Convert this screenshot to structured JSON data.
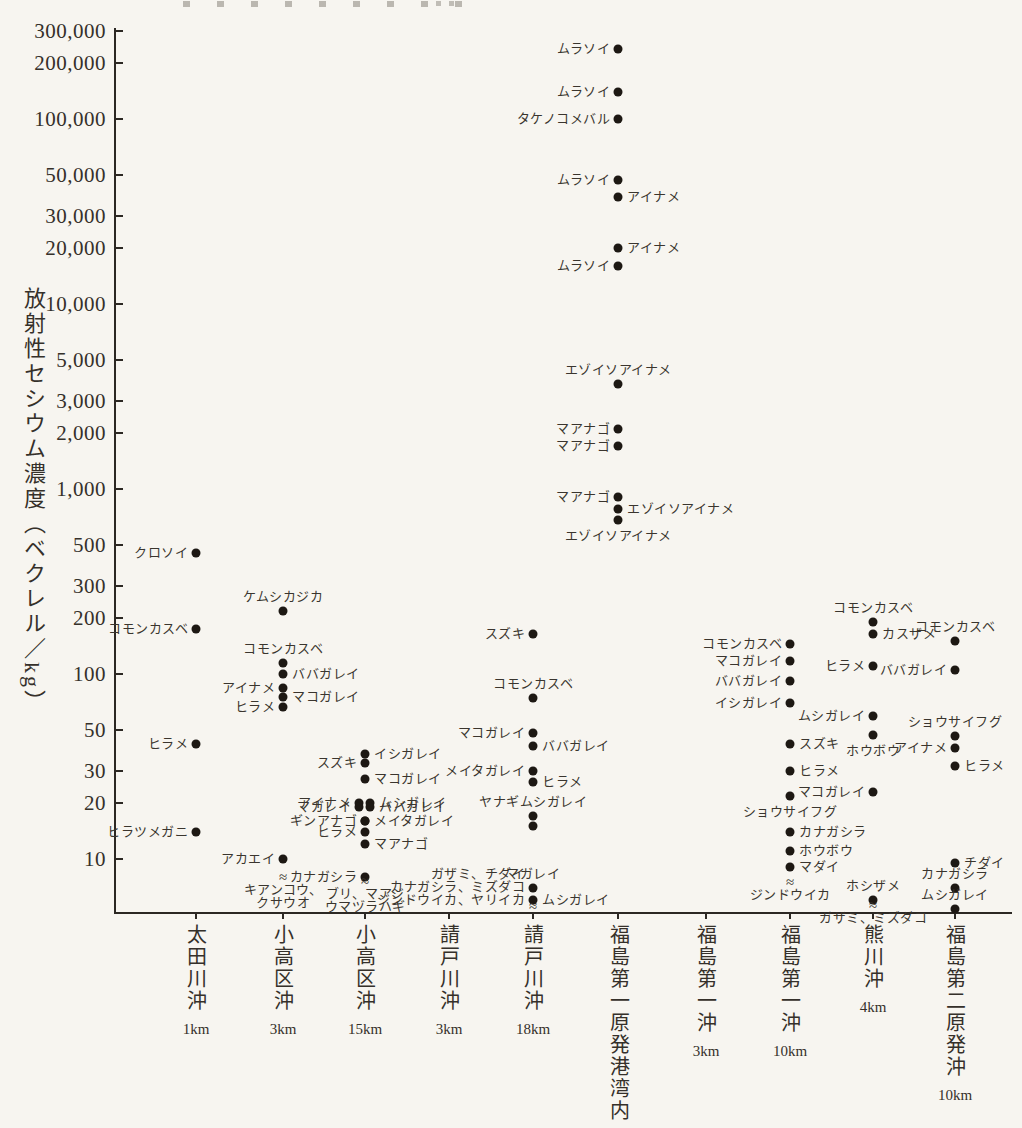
{
  "figure": {
    "background": "#f7f5f0",
    "ink_color": "#2c2823",
    "dot_color": "#1d1813"
  },
  "chart_data": {
    "type": "scatter",
    "title": "",
    "ylabel": "放射性セシウム濃度（ベクレル／kg）",
    "xlabel": "",
    "y_axis": {
      "scale": "log",
      "ylim": [
        5,
        300000
      ],
      "ticks": [
        {
          "label": "300,000",
          "value": 300000
        },
        {
          "label": "200,000",
          "value": 200000
        },
        {
          "label": "100,000",
          "value": 100000
        },
        {
          "label": "50,000",
          "value": 50000
        },
        {
          "label": "30,000",
          "value": 30000
        },
        {
          "label": "20,000",
          "value": 20000
        },
        {
          "label": "10,000",
          "value": 10000
        },
        {
          "label": "5,000",
          "value": 5000
        },
        {
          "label": "3,000",
          "value": 3000
        },
        {
          "label": "2,000",
          "value": 2000
        },
        {
          "label": "1,000",
          "value": 1000
        },
        {
          "label": "500",
          "value": 500
        },
        {
          "label": "300",
          "value": 300
        },
        {
          "label": "200",
          "value": 200
        },
        {
          "label": "100",
          "value": 100
        },
        {
          "label": "50",
          "value": 50
        },
        {
          "label": "30",
          "value": 30
        },
        {
          "label": "20",
          "value": 20
        },
        {
          "label": "10",
          "value": 10
        }
      ]
    },
    "approx_symbol": "≈",
    "locations": [
      {
        "name": "太田川沖",
        "distance": "1km",
        "points": [
          {
            "species": "クロソイ",
            "value": 450,
            "label": "left"
          },
          {
            "species": "コモンカスベ",
            "value": 175,
            "label": "left"
          },
          {
            "species": "ヒラメ",
            "value": 42,
            "label": "left"
          },
          {
            "species": "ヒラツメガニ",
            "value": 14,
            "label": "left"
          }
        ]
      },
      {
        "name": "小高区沖",
        "distance": "3km",
        "points": [
          {
            "species": "ケムシカジカ",
            "value": 220,
            "label": "above"
          },
          {
            "species": "コモンカスベ",
            "value": 115,
            "label": "above"
          },
          {
            "species": "ババガレイ",
            "value": 100,
            "label": "right"
          },
          {
            "species": "アイナメ",
            "value": 84,
            "label": "left"
          },
          {
            "species": "マコガレイ",
            "value": 75,
            "label": "right"
          },
          {
            "species": "ヒラメ",
            "value": 66,
            "label": "left"
          },
          {
            "species": "アカエイ",
            "value": 10,
            "label": "left"
          }
        ],
        "not_detected": [
          "キアンコウ、",
          "クサウオ"
        ]
      },
      {
        "name": "小高区沖",
        "distance": "15km",
        "points": [
          {
            "species": "イシガレイ",
            "value": 37,
            "label": "right"
          },
          {
            "species": "スズキ",
            "value": 33,
            "label": "left"
          },
          {
            "species": "マコガレイ",
            "value": 27,
            "label": "right"
          },
          {
            "species": "アイナメ",
            "value": 20,
            "label": "left",
            "dx": -6
          },
          {
            "species": "ムシガレイ",
            "value": 20,
            "label": "right",
            "dx": 5
          },
          {
            "species": "マガレイ",
            "value": 19,
            "label": "left",
            "dx": -6
          },
          {
            "species": "ババガレイ",
            "value": 19,
            "label": "right",
            "dx": 5
          },
          {
            "species": "ギンアナゴ",
            "value": 16,
            "label": "left"
          },
          {
            "species": "メイタガレイ",
            "value": 16,
            "label": "right"
          },
          {
            "species": "ヒラメ",
            "value": 14,
            "label": "left"
          },
          {
            "species": "マアナゴ",
            "value": 12,
            "label": "right"
          },
          {
            "species": "カナガシラ",
            "value": 8,
            "label": "left"
          }
        ],
        "not_detected": [
          "ブリ、マアジ",
          "ウマヅラハギ"
        ]
      },
      {
        "name": "請戸川沖",
        "distance": "3km",
        "points": []
      },
      {
        "name": "請戸川沖",
        "distance": "18km",
        "points": [
          {
            "species": "スズキ",
            "value": 165,
            "label": "left"
          },
          {
            "species": "コモンカスベ",
            "value": 74,
            "label": "above"
          },
          {
            "species": "マコガレイ",
            "value": 48,
            "label": "left"
          },
          {
            "species": "ババガレイ",
            "value": 41,
            "label": "right"
          },
          {
            "species": "メイタガレイ",
            "value": 30,
            "label": "left"
          },
          {
            "species": "ヒラメ",
            "value": 26,
            "label": "right"
          },
          {
            "species": "ヤナギムシガレイ",
            "value": 17,
            "label": "above"
          },
          {
            "species": "ヤナギムシガレイ",
            "value": 15,
            "label": "none"
          },
          {
            "species": "マガレイ",
            "value": 7,
            "label": "above"
          },
          {
            "species": "ムシガレイ",
            "value": 6,
            "label": "right"
          }
        ],
        "not_detected": [
          "ガザミ、チダイ",
          "カナガシラ、ミズダコ",
          "ジンドウイカ、ヤリイカ"
        ],
        "nd_align": "left"
      },
      {
        "name": "福島第一原発港湾内",
        "distance": "",
        "points": [
          {
            "species": "ムラソイ",
            "value": 240000,
            "label": "left"
          },
          {
            "species": "ムラソイ",
            "value": 140000,
            "label": "left"
          },
          {
            "species": "タケノコメバル",
            "value": 100000,
            "label": "left"
          },
          {
            "species": "ムラソイ",
            "value": 47000,
            "label": "left"
          },
          {
            "species": "アイナメ",
            "value": 38000,
            "label": "right"
          },
          {
            "species": "アイナメ",
            "value": 20000,
            "label": "right"
          },
          {
            "species": "ムラソイ",
            "value": 16000,
            "label": "left"
          },
          {
            "species": "エゾイソアイナメ",
            "value": 3700,
            "label": "above"
          },
          {
            "species": "マアナゴ",
            "value": 2100,
            "label": "left"
          },
          {
            "species": "マアナゴ",
            "value": 1700,
            "label": "left"
          },
          {
            "species": "マアナゴ",
            "value": 900,
            "label": "left"
          },
          {
            "species": "エゾイソアイナメ",
            "value": 780,
            "label": "right"
          },
          {
            "species": "エゾイソアイナメ",
            "value": 680,
            "label": "below"
          }
        ]
      },
      {
        "name": "福島第一沖",
        "distance": "3km",
        "points": []
      },
      {
        "name": "福島第一沖",
        "distance": "10km",
        "points": [
          {
            "species": "コモンカスベ",
            "value": 145,
            "label": "left"
          },
          {
            "species": "マコガレイ",
            "value": 118,
            "label": "left"
          },
          {
            "species": "ババガレイ",
            "value": 92,
            "label": "left"
          },
          {
            "species": "イシガレイ",
            "value": 70,
            "label": "left"
          },
          {
            "species": "スズキ",
            "value": 42,
            "label": "right"
          },
          {
            "species": "ヒラメ",
            "value": 30,
            "label": "right"
          },
          {
            "species": "ショウサイフグ",
            "value": 22,
            "label": "below"
          },
          {
            "species": "カナガシラ",
            "value": 14,
            "label": "right"
          },
          {
            "species": "ホウボウ",
            "value": 11,
            "label": "right"
          },
          {
            "species": "マダイ",
            "value": 9,
            "label": "right"
          }
        ],
        "not_detected": [
          "ジンドウイカ"
        ]
      },
      {
        "name": "熊川沖",
        "distance": "4km",
        "points": [
          {
            "species": "コモンカスベ",
            "value": 190,
            "label": "above"
          },
          {
            "species": "カスザメ",
            "value": 165,
            "label": "right"
          },
          {
            "species": "ヒラメ",
            "value": 110,
            "label": "left"
          },
          {
            "species": "ムシガレイ",
            "value": 59,
            "label": "left"
          },
          {
            "species": "ホウボウ",
            "value": 47,
            "label": "below"
          },
          {
            "species": "マコガレイ",
            "value": 23,
            "label": "left"
          },
          {
            "species": "ホシザメ",
            "value": 6,
            "label": "above"
          }
        ],
        "not_detected": [
          "ガザミ、ミズダコ"
        ]
      },
      {
        "name": "福島第二原発沖",
        "distance": "10km",
        "points": [
          {
            "species": "コモンカスベ",
            "value": 150,
            "label": "above"
          },
          {
            "species": "ババガレイ",
            "value": 105,
            "label": "left"
          },
          {
            "species": "ショウサイフグ",
            "value": 46,
            "label": "above"
          },
          {
            "species": "アイナメ",
            "value": 40,
            "label": "left"
          },
          {
            "species": "ヒラメ",
            "value": 32,
            "label": "right"
          },
          {
            "species": "チダイ",
            "value": 9.5,
            "label": "right"
          },
          {
            "species": "カナガシラ",
            "value": 7,
            "label": "above"
          },
          {
            "species": "ムシガレイ",
            "value": 5.4,
            "label": "above"
          }
        ]
      }
    ]
  }
}
